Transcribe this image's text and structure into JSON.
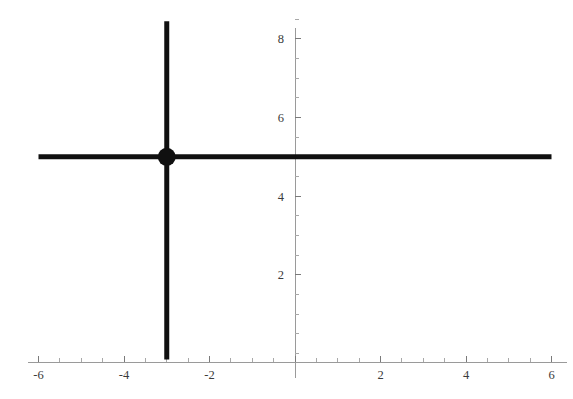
{
  "chart": {
    "title": "",
    "background_color": "#ffffff",
    "line_color": "#101010",
    "axis_color": "#9a9a9a",
    "label_color": "#3a3a3a"
  },
  "chart_data": {
    "type": "line",
    "title": "",
    "subtitle": "",
    "xlabel": "",
    "ylabel": "",
    "xlim": [
      -6.35,
      6.5
    ],
    "ylim": [
      -0.2,
      8.6
    ],
    "grid": false,
    "legend": null,
    "x_ticks": [
      -6,
      -4,
      -2,
      2,
      4,
      6
    ],
    "x_tick_labels": [
      "-6",
      "-4",
      "-2",
      "2",
      "4",
      "6"
    ],
    "y_ticks": [
      2,
      4,
      6,
      8
    ],
    "y_tick_labels": [
      "2",
      "4",
      "6",
      "8"
    ],
    "x_minor_tick_step": 0.5,
    "y_minor_tick_step": 0.5,
    "series": [
      {
        "name": "y = 5",
        "kind": "horizontal-line",
        "equation": "y = 5",
        "y": 5,
        "x_from": -6,
        "x_to": 6,
        "color": "#101010",
        "width": 5
      },
      {
        "name": "x = -3",
        "kind": "vertical-line",
        "equation": "x = -3",
        "x": -3,
        "y_from": -0.15,
        "y_to": 8.45,
        "color": "#101010",
        "width": 5
      }
    ],
    "points": [
      {
        "name": "intersection",
        "x": -3,
        "y": 5,
        "marker": "filled-circle",
        "radius_px": 9,
        "color": "#101010",
        "label": ""
      }
    ]
  },
  "axes": {
    "x_axis_name": "horizontal-axis",
    "y_axis_name": "vertical-axis"
  }
}
